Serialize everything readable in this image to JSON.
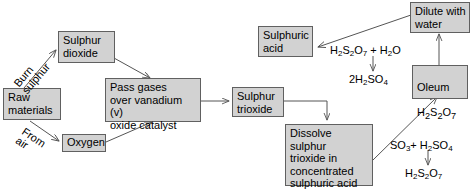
{
  "diagram": {
    "box_fill": "#d2d2d2",
    "box_stroke": "#606060",
    "line_color": "#555555",
    "nodes": [
      {
        "id": "sulphur_dioxide",
        "label": "Sulphur\ndioxide"
      },
      {
        "id": "raw_materials",
        "label": "Raw\nmaterials"
      },
      {
        "id": "oxygen",
        "label": "Oxygen"
      },
      {
        "id": "pass_gases",
        "label": "Pass gases\nover vanadium (v)\noxide catalyst"
      },
      {
        "id": "sulphur_trioxide",
        "label": "Sulphur\ntrioxide"
      },
      {
        "id": "dissolve",
        "label": "Dissolve sulphur\ntrioxide in\nconcentrated\nsulphuric acid"
      },
      {
        "id": "oleum",
        "label": "Oleum"
      },
      {
        "id": "dilute_water",
        "label": "Dilute with\nwater"
      },
      {
        "id": "sulphuric_acid",
        "label": "Sulphuric\nacid"
      }
    ],
    "edge_labels": [
      {
        "id": "burn_sulphur",
        "label": "Burn\nsulphur"
      },
      {
        "id": "from_air",
        "label": "From\nair"
      }
    ],
    "formulas": {
      "oleum_formula": {
        "text": "H2S2O7",
        "parts": [
          "H",
          "2",
          "S",
          "2",
          "O",
          "7"
        ]
      },
      "dilution_reactants": {
        "text": "H2S2O7 + H2O"
      },
      "dilution_products": {
        "text": "2H2SO4"
      },
      "oleum_reactants": {
        "text": "SO3 + H2SO4"
      },
      "oleum_products": {
        "text": "H2S2O7"
      }
    }
  }
}
